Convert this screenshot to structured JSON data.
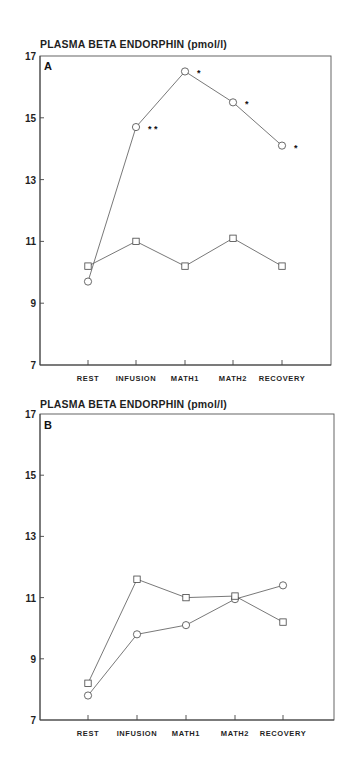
{
  "chart_data": [
    {
      "type": "line",
      "panel": "A",
      "title": "PLASMA BETA ENDORPHIN (pmol/l)",
      "xlabel": "",
      "ylabel": "PLASMA BETA ENDORPHIN (pmol/l)",
      "categories": [
        "REST",
        "INFUSION",
        "MATH1",
        "MATH2",
        "RECOVERY"
      ],
      "yticks": [
        7,
        9,
        11,
        13,
        15,
        17
      ],
      "ylim": [
        7,
        17
      ],
      "grid": false,
      "series": [
        {
          "name": "circle",
          "marker": "circle",
          "values": [
            9.7,
            14.7,
            16.5,
            15.5,
            14.1
          ],
          "annotations": [
            "",
            "**",
            "*",
            "*",
            "*"
          ]
        },
        {
          "name": "square",
          "marker": "square",
          "values": [
            10.2,
            11.0,
            10.2,
            11.1,
            10.2
          ],
          "annotations": [
            "",
            "",
            "",
            "",
            ""
          ]
        }
      ]
    },
    {
      "type": "line",
      "panel": "B",
      "title": "PLASMA BETA ENDORPHIN (pmol/l)",
      "xlabel": "",
      "ylabel": "PLASMA BETA ENDORPHIN (pmol/l)",
      "categories": [
        "REST",
        "INFUSION",
        "MATH1",
        "MATH2",
        "RECOVERY"
      ],
      "yticks": [
        7,
        9,
        11,
        13,
        15,
        17
      ],
      "ylim": [
        7,
        17
      ],
      "grid": false,
      "series": [
        {
          "name": "circle",
          "marker": "circle",
          "values": [
            7.8,
            9.8,
            10.1,
            10.95,
            11.4
          ],
          "annotations": [
            "",
            "",
            "",
            "",
            ""
          ]
        },
        {
          "name": "square",
          "marker": "square",
          "values": [
            8.2,
            11.6,
            11.0,
            11.05,
            10.2
          ],
          "annotations": [
            "",
            "",
            "",
            "",
            ""
          ]
        }
      ]
    }
  ],
  "panels": [
    {
      "letter": "A",
      "title": "PLASMA BETA ENDORPHIN (pmol/l)"
    },
    {
      "letter": "B",
      "title": "PLASMA BETA ENDORPHIN (pmol/l)"
    }
  ],
  "colors": {
    "line": "#555555",
    "marker_stroke": "#444444",
    "background": "#ffffff",
    "text": "#1f1f1f"
  }
}
